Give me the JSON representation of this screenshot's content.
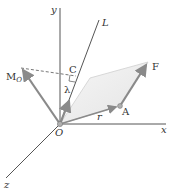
{
  "figure": {
    "type": "vector-moment-about-axis",
    "colors": {
      "axis": "#555555",
      "vector": "#8a8a8a",
      "plane_fill": "#eeeeee",
      "plane_edge": "#cfcfcf",
      "text": "#333333"
    },
    "labels": {
      "y_axis": "y",
      "x_axis": "x",
      "z_axis": "z",
      "line_L": "L",
      "moment_main": "M",
      "moment_sub": "O",
      "point_C": "C",
      "unit_vector": "λ",
      "force": "F",
      "point_A": "A",
      "position_vector": "r",
      "origin": "O"
    }
  }
}
